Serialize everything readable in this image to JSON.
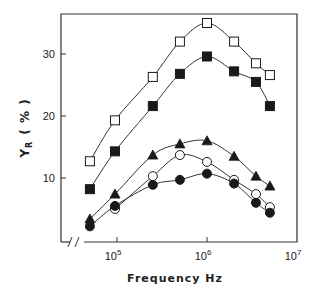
{
  "chart_data": {
    "type": "scatter",
    "title": "",
    "xlabel": "Frequency   Hz",
    "ylabel": "Y_R (%)",
    "ylabel_main": "Y",
    "ylabel_sub": "R",
    "ylabel_unit": "( % )",
    "xscale": "log",
    "xlim": [
      30000,
      10000000
    ],
    "ylim": [
      0,
      37
    ],
    "x_ticks": [
      {
        "value": 100000,
        "base": "10",
        "exp": "5"
      },
      {
        "value": 1000000,
        "base": "10",
        "exp": "6"
      },
      {
        "value": 10000000,
        "base": "10",
        "exp": "7"
      }
    ],
    "y_ticks": [
      {
        "value": 10,
        "label": "10"
      },
      {
        "value": 20,
        "label": "20"
      },
      {
        "value": 30,
        "label": "30"
      }
    ],
    "axis_break": "x-axis break near origin (//)",
    "grid": false,
    "legend": null,
    "x": [
      50000,
      95000,
      250000,
      500000,
      1000000,
      2000000,
      3500000,
      5000000
    ],
    "series": [
      {
        "name": "open squares",
        "marker": "square-open",
        "values": [
          12.7,
          19.3,
          26.3,
          32.0,
          35.0,
          32.0,
          28.5,
          26.6
        ]
      },
      {
        "name": "filled squares",
        "marker": "square-filled",
        "values": [
          8.2,
          14.3,
          21.6,
          26.8,
          29.6,
          27.2,
          25.5,
          21.6
        ]
      },
      {
        "name": "filled triangles",
        "marker": "triangle-filled",
        "values": [
          3.4,
          7.4,
          13.7,
          15.5,
          16.0,
          13.5,
          10.3,
          8.7
        ]
      },
      {
        "name": "open circles",
        "marker": "circle-open",
        "values": [
          null,
          5.0,
          10.3,
          13.7,
          12.6,
          9.7,
          7.4,
          5.3
        ]
      },
      {
        "name": "filled circles",
        "marker": "circle-filled",
        "values": [
          2.2,
          5.5,
          8.9,
          9.7,
          10.7,
          9.1,
          6.0,
          4.4
        ]
      }
    ]
  }
}
